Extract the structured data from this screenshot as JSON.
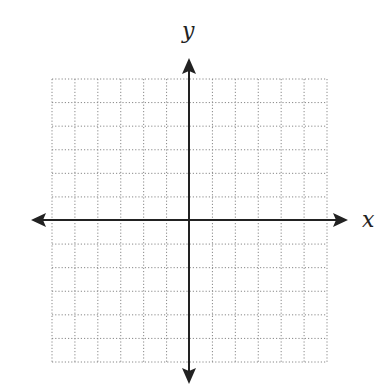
{
  "chart_data": {
    "type": "scatter",
    "title": "",
    "xlabel": "x",
    "ylabel": "y",
    "grid": true,
    "grid_style": "dotted",
    "x_range": [
      -6,
      6
    ],
    "y_range": [
      -6,
      6
    ],
    "grid_columns": 12,
    "grid_rows": 12,
    "tick_labels": false,
    "series": []
  },
  "diagram": {
    "x_axis_label": "x",
    "y_axis_label": "y",
    "colors": {
      "axis": "#222222",
      "grid": "#888888",
      "background": "#ffffff"
    }
  }
}
